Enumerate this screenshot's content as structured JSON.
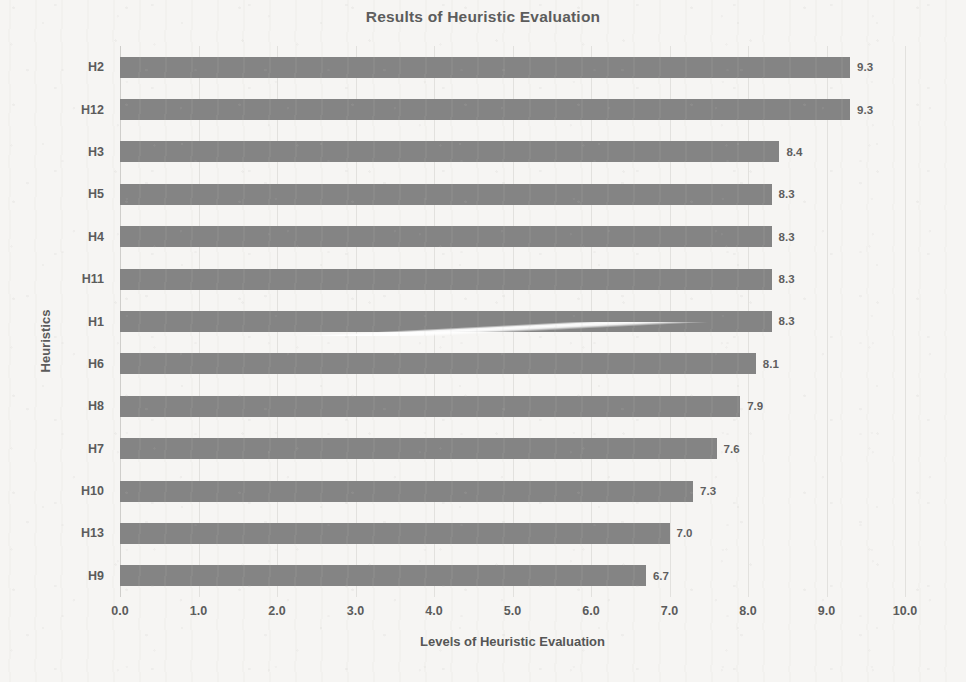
{
  "chart_data": {
    "type": "bar",
    "orientation": "horizontal",
    "title": "Results of Heuristic Evaluation",
    "xlabel": "Levels of Heuristic Evaluation",
    "ylabel": "Heuristics",
    "categories": [
      "H2",
      "H12",
      "H3",
      "H5",
      "H4",
      "H11",
      "H1",
      "H6",
      "H8",
      "H7",
      "H10",
      "H13",
      "H9"
    ],
    "values": [
      9.3,
      9.3,
      8.4,
      8.3,
      8.3,
      8.3,
      8.3,
      8.1,
      7.9,
      7.6,
      7.3,
      7.0,
      6.7
    ],
    "value_labels": [
      "9.3",
      "9.3",
      "8.4",
      "8.3",
      "8.3",
      "8.3",
      "8.3",
      "8.1",
      "7.9",
      "7.6",
      "7.3",
      "7.0",
      "6.7"
    ],
    "xlim": [
      0.0,
      10.0
    ],
    "xticks": [
      0.0,
      1.0,
      2.0,
      3.0,
      4.0,
      5.0,
      6.0,
      7.0,
      8.0,
      9.0,
      10.0
    ],
    "xtick_labels": [
      "0.0",
      "1.0",
      "2.0",
      "3.0",
      "4.0",
      "5.0",
      "6.0",
      "7.0",
      "8.0",
      "9.0",
      "10.0"
    ],
    "grid": true,
    "grid_axis": "x",
    "legend": false,
    "bar_color": "#848484",
    "text_color": "#5b5b5b",
    "grid_color": "#e2e1de",
    "background_color": "#f6f5f3"
  }
}
